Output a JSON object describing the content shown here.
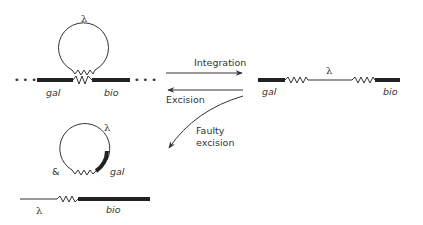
{
  "diagram": {
    "type": "lambda-integration-excision",
    "colors": {
      "ink": "#333333",
      "background": "#ffffff"
    },
    "left_top": {
      "phage_label": "λ",
      "left_gene": "gal",
      "right_gene": "bio",
      "ellipsis_left": "• • •",
      "ellipsis_right": "• • •"
    },
    "arrows": {
      "integration": "Integration",
      "excision": "Excision",
      "faulty_excision_line1": "Faulty",
      "faulty_excision_line2": "excision"
    },
    "right_integrated": {
      "phage_label": "λ",
      "left_gene": "gal",
      "right_gene": "bio"
    },
    "faulty_product": {
      "ampersand": "&",
      "circle_phage_label": "λ",
      "circle_gene": "gal",
      "linear_phage_label": "λ",
      "linear_gene": "bio"
    }
  }
}
